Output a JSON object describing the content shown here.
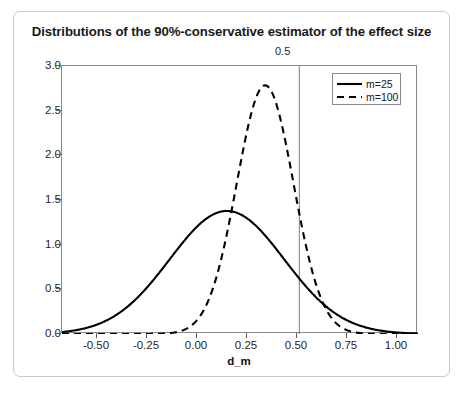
{
  "figure": {
    "title": "Distributions of the 90%-conservative estimator of the effect size"
  },
  "chart_data": {
    "type": "line",
    "title": "Distributions of the 90%-conservative estimator of the effect size",
    "xlabel": "d_m",
    "ylabel": "density",
    "xlim": [
      -0.68,
      1.09
    ],
    "ylim": [
      0.0,
      3.05
    ],
    "xticks": [
      -0.5,
      -0.25,
      0,
      0.25,
      0.5,
      0.75,
      1
    ],
    "xticklabels": [
      "-0.50",
      "-0.25",
      "0.00",
      "0.25",
      "0.50",
      "0.75",
      "1.00"
    ],
    "yticks": [
      0,
      0.5,
      1,
      1.5,
      2,
      2.5,
      3
    ],
    "yticklabels": [
      "0.0",
      "0.5",
      "1.0",
      "1.5",
      "2.0",
      "2.5",
      "3.0"
    ],
    "grid": false,
    "legend_position": "top-right",
    "annotations": [
      {
        "name": "reference-line",
        "label": "0.5",
        "x": 0.5,
        "orientation": "vertical",
        "color": "#808080"
      }
    ],
    "series": [
      {
        "name": "m=25",
        "style": "solid",
        "color": "#000000",
        "distribution": "normal",
        "mean": 0.14,
        "sd": 0.285,
        "peak_density": 1.4,
        "peak_x": 0.14,
        "x": [
          -0.68,
          -0.6,
          -0.5,
          -0.4,
          -0.3,
          -0.25,
          -0.2,
          -0.1,
          0.0,
          0.1,
          0.14,
          0.2,
          0.25,
          0.3,
          0.4,
          0.5,
          0.6,
          0.7,
          0.75,
          0.8,
          0.85,
          0.9,
          1.0
        ],
        "values": [
          0.05,
          0.08,
          0.14,
          0.24,
          0.38,
          0.46,
          0.56,
          0.78,
          1.05,
          1.3,
          1.4,
          1.37,
          1.3,
          1.2,
          0.93,
          0.63,
          0.38,
          0.2,
          0.13,
          0.08,
          0.05,
          0.03,
          0.01
        ]
      },
      {
        "name": "m=100",
        "style": "dashed",
        "color": "#000000",
        "distribution": "normal",
        "mean": 0.33,
        "sd": 0.141,
        "peak_density": 2.83,
        "peak_x": 0.33,
        "x": [
          -0.68,
          -0.3,
          -0.2,
          -0.15,
          -0.1,
          -0.05,
          0.0,
          0.05,
          0.1,
          0.15,
          0.2,
          0.25,
          0.3,
          0.33,
          0.35,
          0.4,
          0.45,
          0.5,
          0.55,
          0.6,
          0.65,
          0.7,
          0.75,
          0.8,
          0.85,
          0.9,
          1.0
        ],
        "values": [
          0.0,
          0.0,
          0.01,
          0.02,
          0.04,
          0.09,
          0.18,
          0.35,
          0.64,
          1.05,
          1.57,
          2.13,
          2.63,
          2.83,
          2.8,
          2.46,
          1.9,
          1.3,
          0.77,
          0.4,
          0.18,
          0.07,
          0.02,
          0.01,
          0.0,
          0.0,
          0.0
        ]
      }
    ]
  },
  "legend": {
    "items": [
      {
        "label": "m=25",
        "style": "solid"
      },
      {
        "label": "m=100",
        "style": "dashed"
      }
    ]
  }
}
